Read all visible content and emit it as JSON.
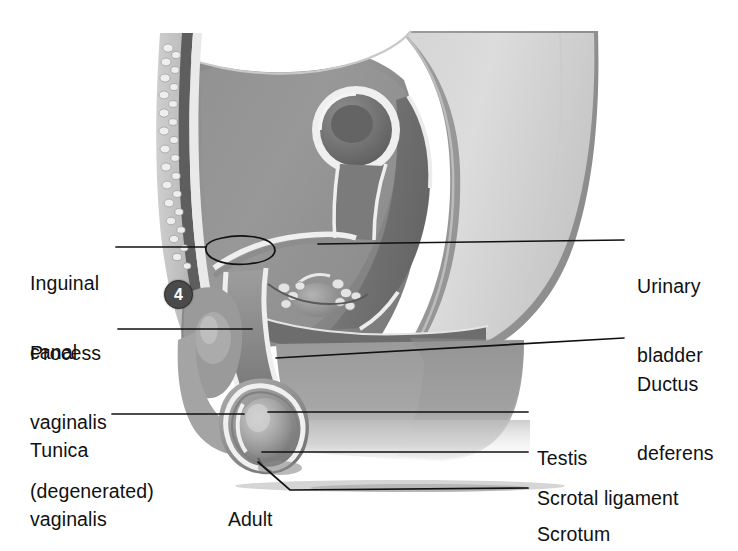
{
  "figure": {
    "title_caption": "Adult",
    "marker": {
      "number": "4"
    },
    "style": {
      "background": "#ffffff",
      "leader_line_color": "#111111",
      "text_color": "#111111",
      "marker_fill": "#4a4a4a",
      "marker_text": "#ffffff",
      "tissue_dark": "#6f6f6f",
      "tissue_mid": "#8d8d8d",
      "tissue_light": "#b9b9b9",
      "tissue_pale": "#d7d7d7",
      "outline_white": "#f2f2f2"
    },
    "labels_left": [
      {
        "id": "inguinal-canal",
        "lines": [
          "Inguinal",
          "canal"
        ]
      },
      {
        "id": "process-vaginalis",
        "lines": [
          "Process",
          "vaginalis",
          "(degenerated)"
        ]
      },
      {
        "id": "tunica-vaginalis",
        "lines": [
          "Tunica",
          "vaginalis"
        ]
      }
    ],
    "labels_right": [
      {
        "id": "urinary-bladder",
        "lines": [
          "Urinary",
          "bladder"
        ]
      },
      {
        "id": "ductus-deferens",
        "lines": [
          "Ductus",
          "deferens"
        ]
      },
      {
        "id": "testis",
        "lines": [
          "Testis"
        ]
      },
      {
        "id": "scrotal-ligament",
        "lines": [
          "Scrotal ligament"
        ]
      },
      {
        "id": "scrotum",
        "lines": [
          "Scrotum"
        ]
      }
    ],
    "label_text": {
      "inguinal_1": "Inguinal",
      "inguinal_2": "canal",
      "process_1": "Process",
      "process_2": "vaginalis",
      "process_3": "(degenerated)",
      "tunica_1": "Tunica",
      "tunica_2": "vaginalis",
      "bladder_1": "Urinary",
      "bladder_2": "bladder",
      "ductus_1": "Ductus",
      "ductus_2": "deferens",
      "testis_1": "Testis",
      "scrotal_lig_1": "Scrotal ligament",
      "scrotum_1": "Scrotum"
    }
  }
}
